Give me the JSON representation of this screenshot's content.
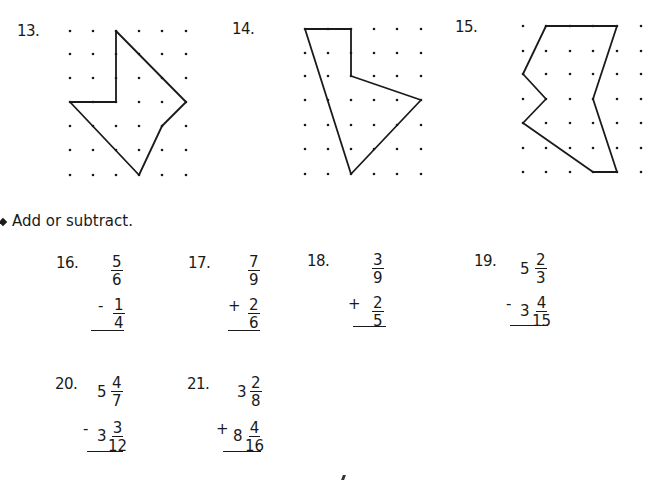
{
  "section1": {
    "problems": [
      {
        "number": "13."
      },
      {
        "number": "14."
      },
      {
        "number": "15."
      }
    ]
  },
  "section2": {
    "instruction": "Add or subtract.",
    "problems": [
      {
        "number": "16.",
        "top": {
          "whole": "",
          "num": "5",
          "den": "6"
        },
        "operator": "-",
        "bottom": {
          "whole": "",
          "num": "1",
          "den": "4"
        }
      },
      {
        "number": "17.",
        "top": {
          "whole": "",
          "num": "7",
          "den": "9"
        },
        "operator": "+",
        "bottom": {
          "whole": "",
          "num": "2",
          "den": "6"
        }
      },
      {
        "number": "18.",
        "top": {
          "whole": "",
          "num": "3",
          "den": "9"
        },
        "operator": "+",
        "bottom": {
          "whole": "",
          "num": "2",
          "den": "5"
        }
      },
      {
        "number": "19.",
        "top": {
          "whole": "5",
          "num": "2",
          "den": "3"
        },
        "operator": "-",
        "bottom": {
          "whole": "3",
          "num": "4",
          "den": "15"
        }
      },
      {
        "number": "20.",
        "top": {
          "whole": "5",
          "num": "4",
          "den": "7"
        },
        "operator": "-",
        "bottom": {
          "whole": "3",
          "num": "3",
          "den": "12"
        }
      },
      {
        "number": "21.",
        "top": {
          "whole": "3",
          "num": "2",
          "den": "8"
        },
        "operator": "+",
        "bottom": {
          "whole": "8",
          "num": "4",
          "den": "16"
        }
      }
    ]
  }
}
